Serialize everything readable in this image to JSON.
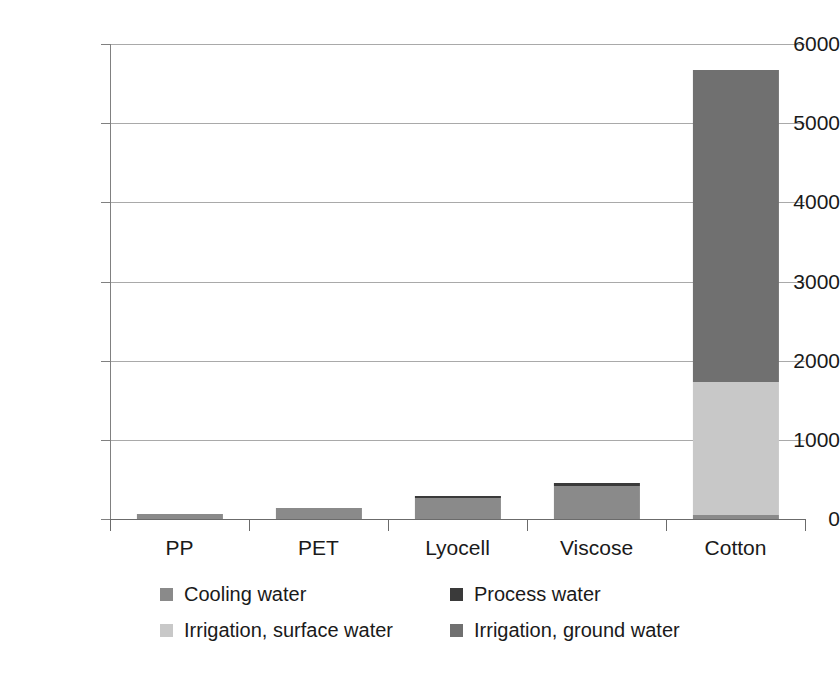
{
  "chart_data": {
    "type": "bar",
    "subtype": "stacked-bar",
    "title": "",
    "xlabel": "",
    "ylabel": "",
    "ylim": [
      0,
      6000
    ],
    "ytick_step": 1000,
    "yticks": [
      6000,
      5000,
      4000,
      3000,
      2000,
      1000,
      0
    ],
    "ytick_labels": [
      "6000",
      "5000",
      "4000",
      "3000",
      "2000",
      "1000",
      "0"
    ],
    "grid": true,
    "grid_axis": "y",
    "legend_position": "bottom",
    "legend_columns": 2,
    "categories": [
      "PP",
      "PET",
      "Lyocell",
      "Viscose",
      "Cotton"
    ],
    "series": [
      {
        "name": "Cooling water",
        "color": "#8a8a8a",
        "values": [
          65,
          135,
          265,
          415,
          50
        ]
      },
      {
        "name": "Process water",
        "color": "#3a3a3a",
        "values": [
          0,
          0,
          20,
          35,
          0
        ]
      },
      {
        "name": "Irrigation, surface water",
        "color": "#c8c8c8",
        "values": [
          0,
          0,
          0,
          0,
          1680
        ]
      },
      {
        "name": "Irrigation, ground water",
        "color": "#707070",
        "values": [
          0,
          0,
          0,
          0,
          3940
        ]
      }
    ],
    "totals": [
      65,
      135,
      285,
      450,
      5670
    ],
    "axis_color": "#6b6b6b",
    "grid_color": "#a9a9a9",
    "background_color": "#ffffff"
  }
}
